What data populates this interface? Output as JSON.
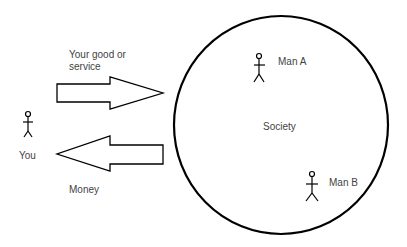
{
  "diagram": {
    "labels": {
      "goods": "Your good or service",
      "goods_line1": "Your good or",
      "goods_line2": "service",
      "money": "Money",
      "you": "You",
      "society": "Society",
      "man_a": "Man A",
      "man_b": "Man B"
    },
    "nodes": [
      {
        "id": "you",
        "label": "You",
        "shape": "stick-figure"
      },
      {
        "id": "society",
        "label": "Society",
        "shape": "circle"
      },
      {
        "id": "man_a",
        "label": "Man A",
        "shape": "stick-figure"
      },
      {
        "id": "man_b",
        "label": "Man B",
        "shape": "stick-figure"
      }
    ],
    "edges": [
      {
        "from": "you",
        "to": "society",
        "label": "Your good or service",
        "shape": "block-arrow"
      },
      {
        "from": "society",
        "to": "you",
        "label": "Money",
        "shape": "block-arrow"
      }
    ],
    "colors": {
      "stroke": "#000000",
      "text": "#444444",
      "background": "#ffffff"
    }
  }
}
